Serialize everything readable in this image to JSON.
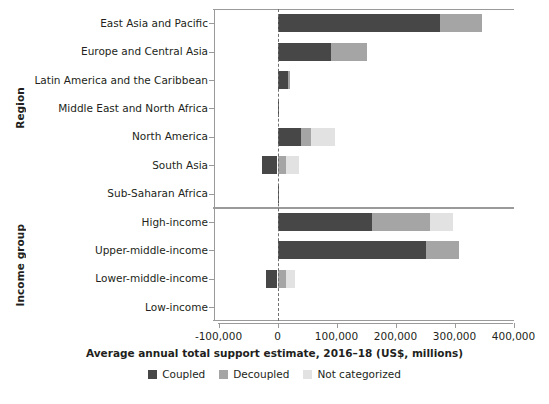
{
  "chart_data": {
    "type": "bar",
    "orientation": "horizontal",
    "stacked": true,
    "title": "",
    "xlabel": "Average annual total support estimate, 2016–18 (US$, millions)",
    "ylabel": "",
    "xlim": [
      -100000,
      400000
    ],
    "xticks": [
      -100000,
      0,
      100000,
      200000,
      300000,
      400000
    ],
    "xtick_labels": [
      "-100,000",
      "0",
      "100,000",
      "200,000",
      "300,000",
      "400,000"
    ],
    "grid": false,
    "zero_reference_line": true,
    "legend_position": "bottom",
    "series": [
      {
        "name": "Coupled",
        "color": "#474747",
        "values": [
          276000,
          90000,
          18000,
          1000,
          39000,
          -27000,
          500,
          161000,
          251000,
          -19000,
          0
        ]
      },
      {
        "name": "Decoupled",
        "color": "#a5a5a5",
        "values": [
          71000,
          62000,
          1000,
          0,
          17000,
          15000,
          0,
          98000,
          56000,
          14000,
          0
        ]
      },
      {
        "name": "Not categorized",
        "color": "#e2e2e2",
        "values": [
          0,
          0,
          0,
          0,
          42000,
          22000,
          0,
          39000,
          0,
          15000,
          0
        ]
      }
    ],
    "panels": [
      {
        "axis_title": "Region",
        "categories": [
          "East Asia and Pacific",
          "Europe and Central Asia",
          "Latin America and the Caribbean",
          "Middle East and North Africa",
          "North America",
          "South Asia",
          "Sub-Saharan Africa"
        ]
      },
      {
        "axis_title": "Income group",
        "categories": [
          "High-income",
          "Upper-middle-income",
          "Lower-middle-income",
          "Low-income"
        ]
      }
    ]
  },
  "legend": {
    "items": [
      {
        "label": "Coupled",
        "color": "#474747"
      },
      {
        "label": "Decoupled",
        "color": "#a5a5a5"
      },
      {
        "label": "Not categorized",
        "color": "#e2e2e2"
      }
    ]
  }
}
